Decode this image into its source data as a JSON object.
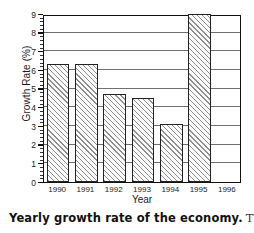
{
  "chart_data": {
    "type": "bar",
    "title": "",
    "xlabel": "Year",
    "ylabel": "Growth Rate (%)",
    "categories": [
      "1990",
      "1991",
      "1992",
      "1993",
      "1994",
      "1995",
      "1996"
    ],
    "values": [
      6.3,
      6.3,
      4.7,
      4.5,
      3.1,
      9.0,
      null
    ],
    "ylim": [
      0,
      9
    ],
    "xlim_note": "categorical",
    "ytick_labels": [
      "0",
      "1",
      "2",
      "3",
      "4",
      "5",
      "6",
      "7",
      "8",
      "9"
    ],
    "ytick_values": [
      0,
      1,
      2,
      3,
      4,
      5,
      6,
      7,
      8,
      9
    ],
    "minor_ticks": true,
    "grid": "horizontal",
    "legend": "none",
    "bar_fill": "diagonal-hatch"
  },
  "caption": {
    "bold_text": "Yearly growth rate of the economy.",
    "rest_text": "This"
  },
  "colors": {
    "axis": "#111111",
    "grid": "#6f6f6f",
    "bar_edge": "#222222",
    "hatch": "#8e8e8e",
    "background": "#ffffff"
  }
}
